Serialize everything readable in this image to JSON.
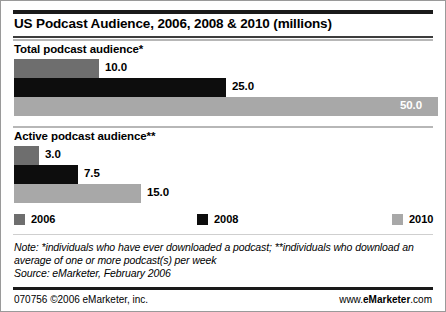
{
  "title": "US Podcast Audience, 2006, 2008 & 2010 (millions)",
  "sections": [
    {
      "heading": "Total podcast audience*"
    },
    {
      "heading": "Active podcast audience**"
    }
  ],
  "legend": [
    {
      "label": "2006",
      "color": "#6e6e6e"
    },
    {
      "label": "2008",
      "color": "#0d0d0d"
    },
    {
      "label": "2010",
      "color": "#a8a8a8"
    }
  ],
  "note": "Note: *individuals who have ever downloaded a podcast; **individuals who download an average of one or more podcast(s) per week",
  "source": "Source: eMarketer, February 2006",
  "footer": {
    "left": "070756 ©2006 eMarketer, inc.",
    "right_prefix": "www.",
    "right_brand": "eMarketer",
    "right_suffix": ".com"
  },
  "chart_data": {
    "type": "bar",
    "title": "US Podcast Audience, 2006, 2008 & 2010 (millions)",
    "orientation": "horizontal",
    "xlabel": "",
    "ylabel": "",
    "unit": "millions",
    "xlim": [
      0,
      50
    ],
    "grid": false,
    "legend_position": "bottom",
    "categories": [
      "Total podcast audience*",
      "Active podcast audience**"
    ],
    "series": [
      {
        "name": "2006",
        "color": "#6e6e6e",
        "values": [
          10.0,
          3.0
        ],
        "labels": [
          "10.0",
          "3.0"
        ]
      },
      {
        "name": "2008",
        "color": "#0d0d0d",
        "values": [
          25.0,
          7.5
        ],
        "labels": [
          "25.0",
          "7.5"
        ]
      },
      {
        "name": "2010",
        "color": "#a8a8a8",
        "values": [
          50.0,
          15.0
        ],
        "labels": [
          "50.0",
          "15.0"
        ]
      }
    ],
    "groups": [
      {
        "category": "Total podcast audience*",
        "bars": [
          {
            "series": "2006",
            "value": 10.0,
            "label": "10.0",
            "color": "#6e6e6e",
            "label_inside": false
          },
          {
            "series": "2008",
            "value": 25.0,
            "label": "25.0",
            "color": "#0d0d0d",
            "label_inside": false
          },
          {
            "series": "2010",
            "value": 50.0,
            "label": "50.0",
            "color": "#a8a8a8",
            "label_inside": true
          }
        ]
      },
      {
        "category": "Active podcast audience**",
        "bars": [
          {
            "series": "2006",
            "value": 3.0,
            "label": "3.0",
            "color": "#6e6e6e",
            "label_inside": false
          },
          {
            "series": "2008",
            "value": 7.5,
            "label": "7.5",
            "color": "#0d0d0d",
            "label_inside": false
          },
          {
            "series": "2010",
            "value": 15.0,
            "label": "15.0",
            "color": "#a8a8a8",
            "label_inside": false
          }
        ]
      }
    ],
    "annotations": [
      "Note: *individuals who have ever downloaded a podcast; **individuals who download an average of one or more podcast(s) per week",
      "Source: eMarketer, February 2006"
    ]
  }
}
